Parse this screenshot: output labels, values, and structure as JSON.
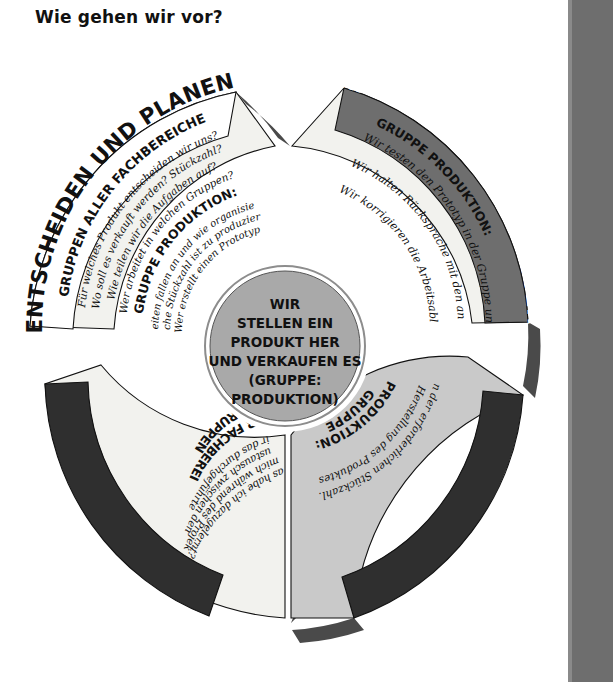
{
  "page": {
    "title": "Wie gehen wir vor?",
    "background": "#ffffff",
    "side_bar_color": "#6e6e6e"
  },
  "colors": {
    "band_dark": "#2f2f2f",
    "band_mid": "#6e6e6e",
    "segment_fill_light": "#f2f2ee",
    "segment_fill_gray": "#c9c9c9",
    "hub_fill": "#a9a9a9",
    "shadow": "#4a4a4a",
    "text_dark": "#111111",
    "text_light": "#ffffff"
  },
  "hub": {
    "name": "center-circle",
    "lines": [
      "WIR",
      "STELLEN EIN",
      "PRODUKT HER",
      "UND VERKAUFEN ES",
      "(GRUPPE:",
      "PRODUKTION)"
    ]
  },
  "segments": [
    {
      "id": "entscheiden-und-planen",
      "band_label": "ENTSCHEIDEN UND PLANEN",
      "band_color": "#ffffff",
      "band_text_color": "#111111",
      "fill": "#f2f2ee",
      "groups": [
        {
          "heading": "GRUPPEN ALLER FACHBEREICHE",
          "bullets": [
            "Für welches Produkt entscheiden wir uns?",
            "Wo soll es verkauft werden? Stückzahl?",
            "Wie teilen wir die Aufgaben auf?",
            "Wer arbeitet in welchen Gruppen?"
          ]
        },
        {
          "heading": "GRUPPE PRODUKTION:",
          "bullets": [
            "Welche Arbeiten fallen an und wie organisieren wir sie?",
            "Welche Stückzahl ist zu produzieren?",
            "Wer erstellt einen Prototyp?"
          ]
        }
      ]
    },
    {
      "id": "erproben-und-verbessern",
      "band_label": "ERPROBEN UND VERBESSERN",
      "band_color": "#6e6e6e",
      "band_text_color": "#ffffff",
      "fill": "#f2f2ee",
      "groups": [
        {
          "heading": "GRUPPE PRODUKTION:",
          "bullets": [
            "Wir testen den Prototyp in der Gruppe und beraten ihn.",
            "Wir halten Rücksprache mit den anderen Gruppen und informieren sie über unsere Erkenntnisse.",
            "Wir korrigieren die Arbeitsabläufe und gestalten sie rationeller."
          ]
        }
      ]
    },
    {
      "id": "durchfuehren",
      "band_label": "DURCHFÜHREN",
      "band_color": "#2f2f2f",
      "band_text_color": "#ffffff",
      "fill": "#c9c9c9",
      "groups": [
        {
          "heading": "GRUPPE PRODUKTION:",
          "bullets": [
            "Herstellung des Produktes in der erforderlichen Stückzahl."
          ]
        }
      ]
    },
    {
      "id": "auswerten",
      "band_label": "AUSWERTEN",
      "band_color": "#2f2f2f",
      "band_text_color": "#ffffff",
      "fill": "#f2f2ee",
      "groups": [
        {
          "heading": "GRUPPEN ALLER FACHBEREICHE",
          "bullets": [
            "Wie beurteilen wir das durchgeführte Unternehmen?",
            "Wie hat der Informationsaustausch zwischen den Gruppen funktioniert?",
            "Wie habe ich mich während des Projekts gefühlt?",
            "Was habe ich dazugelernt?"
          ]
        }
      ]
    }
  ]
}
